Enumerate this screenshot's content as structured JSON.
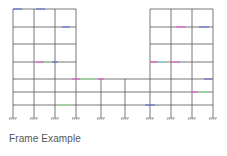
{
  "caption": "Frame Example",
  "colors": {
    "member": "#555555",
    "support": "#777777",
    "marker_blue": "#5b6fd6",
    "marker_pink": "#e05cc8",
    "marker_green": "#8fe08f",
    "marker_cyan": "#7fd8e0"
  },
  "frame": {
    "columns_x": [
      13,
      34,
      55,
      76,
      101,
      125,
      150,
      171,
      192,
      213
    ],
    "floors_y": [
      9,
      27,
      44,
      62,
      79,
      92,
      105
    ],
    "support_y": 118,
    "left_tower": {
      "x_from": 13,
      "x_to": 76,
      "top_floor_y": 9
    },
    "right_tower": {
      "x_from": 150,
      "x_to": 213,
      "top_floor_y": 9
    },
    "podium": {
      "x_from": 13,
      "x_to": 213,
      "top_floor_y": 79
    },
    "middle_columns_x": [
      101,
      125
    ]
  }
}
